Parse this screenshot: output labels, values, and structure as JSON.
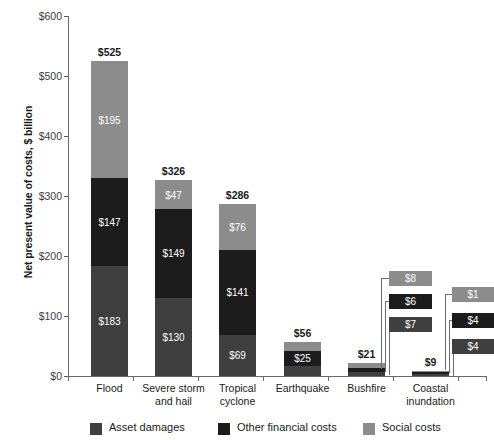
{
  "chart_data": {
    "type": "bar",
    "subtype": "stacked-bar",
    "title": "",
    "xlabel": "",
    "ylabel": "Net present value of costs, $ billion",
    "ylim": [
      0,
      600
    ],
    "ytick_values": [
      0,
      100,
      200,
      300,
      400,
      500,
      600
    ],
    "ytick_labels": [
      "$0",
      "$100",
      "$200",
      "$300",
      "$400",
      "$500",
      "$600"
    ],
    "grid": false,
    "legend_position": "bottom",
    "categories": [
      "Flood",
      "Severe storm\nand hail",
      "Tropical\ncyclone",
      "Earthquake",
      "Bushfire",
      "Coastal\ninundation"
    ],
    "series": [
      {
        "name": "Asset damages",
        "color": "#3f3f3f",
        "values": [
          183,
          130,
          69,
          17,
          7,
          4
        ],
        "labels": [
          "$183",
          "$130",
          "$69",
          "$17",
          "$7",
          "$4"
        ]
      },
      {
        "name": "Other financial costs",
        "color": "#1c1c1c",
        "values": [
          147,
          149,
          141,
          25,
          6,
          4
        ],
        "labels": [
          "$147",
          "$149",
          "$141",
          "$25",
          "$6",
          "$4"
        ]
      },
      {
        "name": "Social costs",
        "color": "#8c8c8c",
        "values": [
          195,
          47,
          76,
          14,
          8,
          1
        ],
        "labels": [
          "$195",
          "$47",
          "$76",
          "$14",
          "$8",
          "$1"
        ]
      }
    ],
    "totals": [
      525,
      326,
      286,
      56,
      21,
      9
    ],
    "total_labels": [
      "$525",
      "$326",
      "$286",
      "$56",
      "$21",
      "$9"
    ]
  },
  "y_axis": {
    "title": "Net present value of costs, $ billion",
    "ticks": [
      {
        "label": "$600",
        "value": 600
      },
      {
        "label": "$500",
        "value": 500
      },
      {
        "label": "$400",
        "value": 400
      },
      {
        "label": "$300",
        "value": 300
      },
      {
        "label": "$200",
        "value": 200
      },
      {
        "label": "$100",
        "value": 100
      },
      {
        "label": "$0",
        "value": 0
      }
    ]
  },
  "x_axis": {
    "categories": [
      {
        "label": "Flood"
      },
      {
        "label": "Severe storm\nand hail"
      },
      {
        "label": "Tropical\ncyclone"
      },
      {
        "label": "Earthquake"
      },
      {
        "label": "Bushfire"
      },
      {
        "label": "Coastal\ninundation"
      }
    ]
  },
  "bars": [
    {
      "category": "Flood",
      "total_label": "$525",
      "callouts": false,
      "segments": [
        {
          "series": "Social costs",
          "label": "$195"
        },
        {
          "series": "Other financial costs",
          "label": "$147"
        },
        {
          "series": "Asset damages",
          "label": "$183"
        }
      ]
    },
    {
      "category": "Severe storm and hail",
      "total_label": "$326",
      "callouts": false,
      "segments": [
        {
          "series": "Social costs",
          "label": "$47"
        },
        {
          "series": "Other financial costs",
          "label": "$149"
        },
        {
          "series": "Asset damages",
          "label": "$130"
        }
      ]
    },
    {
      "category": "Tropical cyclone",
      "total_label": "$286",
      "callouts": false,
      "segments": [
        {
          "series": "Social costs",
          "label": "$76"
        },
        {
          "series": "Other financial costs",
          "label": "$141"
        },
        {
          "series": "Asset damages",
          "label": "$69"
        }
      ]
    },
    {
      "category": "Earthquake",
      "total_label": "$56",
      "callouts": false,
      "segments": [
        {
          "series": "Social costs",
          "label": "$14"
        },
        {
          "series": "Other financial costs",
          "label": "$25"
        },
        {
          "series": "Asset damages",
          "label": "$17"
        }
      ]
    },
    {
      "category": "Bushfire",
      "total_label": "$21",
      "callouts": true,
      "segments": [
        {
          "series": "Social costs",
          "label": "$8"
        },
        {
          "series": "Other financial costs",
          "label": "$6"
        },
        {
          "series": "Asset damages",
          "label": "$7"
        }
      ]
    },
    {
      "category": "Coastal inundation",
      "total_label": "$9",
      "callouts": true,
      "segments": [
        {
          "series": "Social costs",
          "label": "$1"
        },
        {
          "series": "Other financial costs",
          "label": "$4"
        },
        {
          "series": "Asset damages",
          "label": "$4"
        }
      ]
    }
  ],
  "legend": {
    "items": [
      {
        "label": "Asset damages",
        "color": "#3f3f3f"
      },
      {
        "label": "Other financial costs",
        "color": "#1c1c1c"
      },
      {
        "label": "Social costs",
        "color": "#8c8c8c"
      }
    ]
  },
  "colors": {
    "asset_damages": "#3f3f3f",
    "other_financial_costs": "#1c1c1c",
    "social_costs": "#8c8c8c",
    "axis": "#6a6a6a",
    "text": "#1a1a1a",
    "background": "#ffffff"
  }
}
